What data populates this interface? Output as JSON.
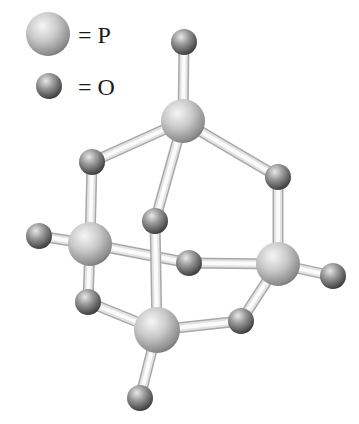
{
  "diagram": {
    "colors": {
      "background": "#ffffff",
      "p_light": "#f4f4f4",
      "p_mid": "#bdbdbd",
      "p_dark": "#6e6e6e",
      "o_light": "#e6e6e6",
      "o_mid": "#8c8c8c",
      "o_dark": "#3c3c3c",
      "bond_light": "#fbfbfb",
      "bond_edge": "#a8a8a8"
    },
    "legend": [
      {
        "element": "P",
        "label": "= P",
        "cx": 48,
        "cy": 34,
        "r": 22,
        "tx": 78,
        "ty": 43
      },
      {
        "element": "O",
        "label": "= O",
        "cx": 49,
        "cy": 86,
        "r": 13,
        "tx": 78,
        "ty": 95
      }
    ],
    "atoms": [
      {
        "id": "O_top",
        "element": "O",
        "cx": 184,
        "cy": 42,
        "r": 13
      },
      {
        "id": "P_top",
        "element": "P",
        "cx": 183,
        "cy": 121,
        "r": 22
      },
      {
        "id": "O_ul",
        "element": "O",
        "cx": 92,
        "cy": 162,
        "r": 13
      },
      {
        "id": "O_ur",
        "element": "O",
        "cx": 278,
        "cy": 177,
        "r": 13
      },
      {
        "id": "O_mid",
        "element": "O",
        "cx": 155,
        "cy": 221,
        "r": 13
      },
      {
        "id": "O_left",
        "element": "O",
        "cx": 39,
        "cy": 236,
        "r": 13
      },
      {
        "id": "P_left",
        "element": "P",
        "cx": 90,
        "cy": 244,
        "r": 22
      },
      {
        "id": "O_center",
        "element": "O",
        "cx": 189,
        "cy": 263,
        "r": 13
      },
      {
        "id": "P_right",
        "element": "P",
        "cx": 278,
        "cy": 264,
        "r": 22
      },
      {
        "id": "O_right",
        "element": "O",
        "cx": 333,
        "cy": 276,
        "r": 13
      },
      {
        "id": "O_ll",
        "element": "O",
        "cx": 88,
        "cy": 302,
        "r": 13
      },
      {
        "id": "O_lr",
        "element": "O",
        "cx": 241,
        "cy": 321,
        "r": 13
      },
      {
        "id": "P_bottom",
        "element": "P",
        "cx": 157,
        "cy": 330,
        "r": 23
      },
      {
        "id": "O_bottom",
        "element": "O",
        "cx": 140,
        "cy": 398,
        "r": 13
      }
    ],
    "bonds": [
      {
        "from": "O_top",
        "to": "P_top"
      },
      {
        "from": "P_top",
        "to": "O_ul"
      },
      {
        "from": "P_top",
        "to": "O_ur"
      },
      {
        "from": "P_top",
        "to": "O_mid"
      },
      {
        "from": "O_ul",
        "to": "P_left"
      },
      {
        "from": "O_ur",
        "to": "P_right"
      },
      {
        "from": "O_left",
        "to": "P_left"
      },
      {
        "from": "P_left",
        "to": "O_center"
      },
      {
        "from": "O_center",
        "to": "P_right"
      },
      {
        "from": "P_right",
        "to": "O_right"
      },
      {
        "from": "P_left",
        "to": "O_ll"
      },
      {
        "from": "O_ll",
        "to": "P_bottom"
      },
      {
        "from": "O_mid",
        "to": "P_bottom"
      },
      {
        "from": "P_bottom",
        "to": "O_lr"
      },
      {
        "from": "O_lr",
        "to": "P_right"
      },
      {
        "from": "P_bottom",
        "to": "O_bottom"
      }
    ],
    "draw_order": [
      "O_mid",
      "O_top",
      "P_top",
      "O_ul",
      "O_ur",
      "O_left",
      "P_left",
      "O_center",
      "P_right",
      "O_right",
      "O_ll",
      "O_lr",
      "P_bottom",
      "O_bottom"
    ]
  }
}
